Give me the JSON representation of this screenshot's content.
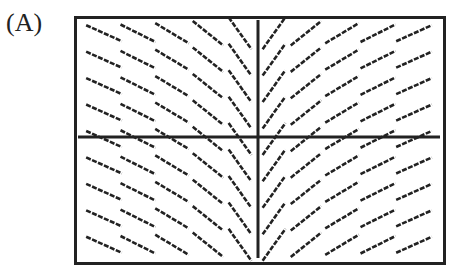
{
  "figure": {
    "label": "(A)",
    "colors": {
      "line": "#222222",
      "background": "#ffffff"
    },
    "grid": {
      "columns_left": 5,
      "columns_right": 5,
      "rows": 9
    },
    "axes": {
      "x_axis_y_px": 137,
      "y_axis_x_px": 258
    }
  }
}
